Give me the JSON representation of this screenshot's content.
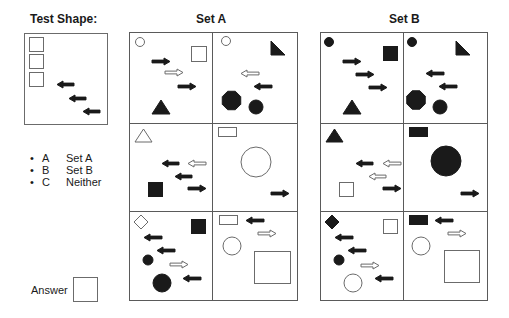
{
  "test_shape": {
    "heading": "Test Shape:",
    "shapes": [
      {
        "type": "square",
        "x": 4,
        "y": 3,
        "w": 14,
        "h": 14,
        "fill": "white"
      },
      {
        "type": "square",
        "x": 4,
        "y": 20,
        "w": 14,
        "h": 14,
        "fill": "white"
      },
      {
        "type": "square",
        "x": 4,
        "y": 38,
        "w": 14,
        "h": 14,
        "fill": "white"
      },
      {
        "type": "arrow",
        "dir": "left",
        "x": 32,
        "y": 47,
        "w": 17,
        "h": 7,
        "fill": "black"
      },
      {
        "type": "arrow",
        "dir": "left",
        "x": 44,
        "y": 61,
        "w": 17,
        "h": 7,
        "fill": "black"
      },
      {
        "type": "arrow",
        "dir": "left",
        "x": 58,
        "y": 74,
        "w": 17,
        "h": 7,
        "fill": "black"
      }
    ]
  },
  "options": [
    {
      "bullet": "•",
      "key": "A",
      "label": "Set A"
    },
    {
      "bullet": "•",
      "key": "B",
      "label": "Set B"
    },
    {
      "bullet": "•",
      "key": "C",
      "label": "Neither"
    }
  ],
  "answer": {
    "label": "Answer",
    "value": ""
  },
  "set_a": {
    "heading": "Set A",
    "cells": [
      {
        "shapes": [
          {
            "type": "circle",
            "cx": 10,
            "cy": 9,
            "r": 4.5,
            "fill": "white"
          },
          {
            "type": "square",
            "x": 61,
            "y": 13,
            "w": 15,
            "h": 15,
            "fill": "white"
          },
          {
            "type": "arrow",
            "dir": "right",
            "x": 22,
            "y": 25,
            "w": 18,
            "h": 7,
            "fill": "black"
          },
          {
            "type": "arrow",
            "dir": "right",
            "x": 35,
            "y": 36,
            "w": 18,
            "h": 7,
            "fill": "white"
          },
          {
            "type": "arrow",
            "dir": "right",
            "x": 48,
            "y": 50,
            "w": 18,
            "h": 7,
            "fill": "black"
          },
          {
            "type": "triangle",
            "x": 22,
            "y": 67,
            "w": 18,
            "h": 14,
            "fill": "black"
          }
        ]
      },
      {
        "shapes": [
          {
            "type": "circle",
            "cx": 13,
            "cy": 8,
            "r": 4.5,
            "fill": "white"
          },
          {
            "type": "right-triangle",
            "x": 58,
            "y": 8,
            "w": 14,
            "h": 14,
            "fill": "black"
          },
          {
            "type": "arrow",
            "dir": "left",
            "x": 28,
            "y": 37,
            "w": 18,
            "h": 7,
            "fill": "white"
          },
          {
            "type": "arrow",
            "dir": "left",
            "x": 41,
            "y": 50,
            "w": 18,
            "h": 7,
            "fill": "black"
          },
          {
            "type": "octagon",
            "cx": 18.5,
            "cy": 67.5,
            "r": 10,
            "fill": "black"
          },
          {
            "type": "circle",
            "cx": 43,
            "cy": 74,
            "r": 7,
            "fill": "black"
          }
        ]
      },
      {
        "shapes": [
          {
            "type": "triangle",
            "x": 5,
            "y": 5,
            "w": 17,
            "h": 13,
            "fill": "white"
          },
          {
            "type": "arrow",
            "dir": "left",
            "x": 32,
            "y": 36,
            "w": 17,
            "h": 7,
            "fill": "black"
          },
          {
            "type": "arrow",
            "dir": "left",
            "x": 58,
            "y": 36,
            "w": 18,
            "h": 7,
            "fill": "white"
          },
          {
            "type": "arrow",
            "dir": "left",
            "x": 45,
            "y": 49,
            "w": 17,
            "h": 7,
            "fill": "black"
          },
          {
            "type": "square",
            "x": 18,
            "y": 58,
            "w": 14,
            "h": 14,
            "fill": "black"
          },
          {
            "type": "arrow",
            "dir": "right",
            "x": 58,
            "y": 61,
            "w": 18,
            "h": 7,
            "fill": "black"
          }
        ]
      },
      {
        "shapes": [
          {
            "type": "rect",
            "x": 5,
            "y": 3,
            "w": 18,
            "h": 9,
            "fill": "white"
          },
          {
            "type": "circle",
            "cx": 43,
            "cy": 38,
            "r": 15,
            "fill": "white"
          },
          {
            "type": "arrow",
            "dir": "right",
            "x": 58,
            "y": 66,
            "w": 18,
            "h": 7,
            "fill": "black"
          }
        ]
      },
      {
        "shapes": [
          {
            "type": "diamond",
            "cx": 11,
            "cy": 10,
            "r": 7,
            "fill": "white"
          },
          {
            "type": "square",
            "x": 61,
            "y": 7,
            "w": 14,
            "h": 14,
            "fill": "black"
          },
          {
            "type": "arrow",
            "dir": "left",
            "x": 14,
            "y": 22,
            "w": 18,
            "h": 7,
            "fill": "black"
          },
          {
            "type": "arrow",
            "dir": "left",
            "x": 27,
            "y": 35,
            "w": 18,
            "h": 7,
            "fill": "black"
          },
          {
            "type": "circle",
            "cx": 18,
            "cy": 48,
            "r": 5,
            "fill": "black"
          },
          {
            "type": "arrow",
            "dir": "right",
            "x": 40,
            "y": 49,
            "w": 18,
            "h": 7,
            "fill": "white"
          },
          {
            "type": "circle",
            "cx": 32,
            "cy": 71,
            "r": 9,
            "fill": "black"
          },
          {
            "type": "arrow",
            "dir": "left",
            "x": 53,
            "y": 63,
            "w": 18,
            "h": 7,
            "fill": "black"
          }
        ]
      },
      {
        "shapes": [
          {
            "type": "rect",
            "x": 6,
            "y": 3,
            "w": 18,
            "h": 9,
            "fill": "white"
          },
          {
            "type": "arrow",
            "dir": "left",
            "x": 33,
            "y": 5,
            "w": 18,
            "h": 7,
            "fill": "black"
          },
          {
            "type": "arrow",
            "dir": "right",
            "x": 45,
            "y": 18,
            "w": 18,
            "h": 7,
            "fill": "white"
          },
          {
            "type": "circle",
            "cx": 19,
            "cy": 34,
            "r": 9,
            "fill": "white"
          },
          {
            "type": "square",
            "x": 41,
            "y": 39,
            "w": 36,
            "h": 32,
            "fill": "white"
          }
        ]
      }
    ]
  },
  "set_b": {
    "heading": "Set B",
    "cells": [
      {
        "shapes": [
          {
            "type": "circle",
            "cx": 8,
            "cy": 9,
            "r": 4.5,
            "fill": "black"
          },
          {
            "type": "square",
            "x": 62,
            "y": 13,
            "w": 14,
            "h": 14,
            "fill": "black"
          },
          {
            "type": "arrow",
            "dir": "right",
            "x": 22,
            "y": 25,
            "w": 18,
            "h": 7,
            "fill": "black"
          },
          {
            "type": "arrow",
            "dir": "right",
            "x": 35,
            "y": 38,
            "w": 18,
            "h": 7,
            "fill": "black"
          },
          {
            "type": "arrow",
            "dir": "right",
            "x": 48,
            "y": 51,
            "w": 18,
            "h": 7,
            "fill": "black"
          },
          {
            "type": "triangle",
            "x": 22,
            "y": 67,
            "w": 18,
            "h": 14,
            "fill": "black"
          }
        ]
      },
      {
        "shapes": [
          {
            "type": "circle",
            "cx": 8,
            "cy": 9,
            "r": 4.5,
            "fill": "black"
          },
          {
            "type": "right-triangle",
            "x": 52,
            "y": 8,
            "w": 14,
            "h": 14,
            "fill": "black"
          },
          {
            "type": "arrow",
            "dir": "left",
            "x": 22,
            "y": 37,
            "w": 18,
            "h": 7,
            "fill": "black"
          },
          {
            "type": "arrow",
            "dir": "left",
            "x": 35,
            "y": 50,
            "w": 18,
            "h": 7,
            "fill": "black"
          },
          {
            "type": "octagon",
            "cx": 12,
            "cy": 67,
            "r": 10,
            "fill": "black"
          },
          {
            "type": "circle",
            "cx": 36,
            "cy": 74,
            "r": 7,
            "fill": "black"
          }
        ]
      },
      {
        "shapes": [
          {
            "type": "triangle",
            "x": 5,
            "y": 5,
            "w": 17,
            "h": 13,
            "fill": "black"
          },
          {
            "type": "arrow",
            "dir": "left",
            "x": 35,
            "y": 36,
            "w": 17,
            "h": 7,
            "fill": "black"
          },
          {
            "type": "arrow",
            "dir": "left",
            "x": 62,
            "y": 36,
            "w": 18,
            "h": 7,
            "fill": "white"
          },
          {
            "type": "arrow",
            "dir": "left",
            "x": 48,
            "y": 49,
            "w": 17,
            "h": 7,
            "fill": "white"
          },
          {
            "type": "square",
            "x": 18,
            "y": 58,
            "w": 14,
            "h": 14,
            "fill": "white"
          },
          {
            "type": "arrow",
            "dir": "right",
            "x": 62,
            "y": 61,
            "w": 18,
            "h": 7,
            "fill": "black"
          }
        ]
      },
      {
        "shapes": [
          {
            "type": "rect",
            "x": 5,
            "y": 3,
            "w": 18,
            "h": 9,
            "fill": "black"
          },
          {
            "type": "circle",
            "cx": 42,
            "cy": 37,
            "r": 15,
            "fill": "black"
          },
          {
            "type": "arrow",
            "dir": "right",
            "x": 57,
            "y": 66,
            "w": 18,
            "h": 7,
            "fill": "black"
          }
        ]
      },
      {
        "shapes": [
          {
            "type": "diamond",
            "cx": 11,
            "cy": 10,
            "r": 7,
            "fill": "black"
          },
          {
            "type": "square",
            "x": 62,
            "y": 7,
            "w": 14,
            "h": 14,
            "fill": "white"
          },
          {
            "type": "arrow",
            "dir": "left",
            "x": 14,
            "y": 22,
            "w": 18,
            "h": 7,
            "fill": "black"
          },
          {
            "type": "arrow",
            "dir": "left",
            "x": 27,
            "y": 35,
            "w": 18,
            "h": 7,
            "fill": "black"
          },
          {
            "type": "circle",
            "cx": 18,
            "cy": 48,
            "r": 5,
            "fill": "black"
          },
          {
            "type": "arrow",
            "dir": "right",
            "x": 40,
            "y": 50,
            "w": 18,
            "h": 7,
            "fill": "white"
          },
          {
            "type": "circle",
            "cx": 32,
            "cy": 71,
            "r": 9,
            "fill": "white"
          },
          {
            "type": "arrow",
            "dir": "left",
            "x": 54,
            "y": 63,
            "w": 18,
            "h": 7,
            "fill": "black"
          }
        ]
      },
      {
        "shapes": [
          {
            "type": "rect",
            "x": 5,
            "y": 3,
            "w": 18,
            "h": 9,
            "fill": "black"
          },
          {
            "type": "arrow",
            "dir": "left",
            "x": 31,
            "y": 5,
            "w": 18,
            "h": 7,
            "fill": "black"
          },
          {
            "type": "arrow",
            "dir": "right",
            "x": 44,
            "y": 18,
            "w": 18,
            "h": 7,
            "fill": "white"
          },
          {
            "type": "circle",
            "cx": 17,
            "cy": 34,
            "r": 9,
            "fill": "white"
          },
          {
            "type": "square",
            "x": 40,
            "y": 38,
            "w": 35,
            "h": 32,
            "fill": "white"
          }
        ]
      }
    ]
  },
  "colors": {
    "ink": "#1a1a1a",
    "outline": "#6b6b6b",
    "paper": "#ffffff"
  }
}
